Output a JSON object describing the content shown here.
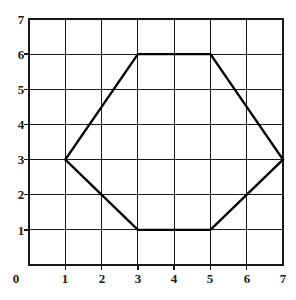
{
  "figure": {
    "kind": "coordinate-grid-with-polygon",
    "background_color": "#ffffff",
    "grid_color": "#1a1a1a",
    "shape_color": "#000000",
    "label_color": "#1a1a1a"
  },
  "chart_data": {
    "type": "scatter",
    "title": "",
    "xlabel": "",
    "ylabel": "",
    "xlim": [
      0,
      7
    ],
    "ylim": [
      0,
      7
    ],
    "grid": true,
    "legend": null,
    "x_ticks": [
      0,
      1,
      2,
      3,
      4,
      5,
      6,
      7
    ],
    "y_ticks": [
      0,
      1,
      2,
      3,
      4,
      5,
      6,
      7
    ],
    "x_tick_labels": [
      "0",
      "1",
      "2",
      "3",
      "4",
      "5",
      "6",
      "7"
    ],
    "y_tick_labels": [
      "0",
      "1",
      "2",
      "3",
      "4",
      "5",
      "6",
      "7"
    ],
    "annotations": [],
    "series": [
      {
        "name": "hexagon",
        "type": "polygon",
        "closed": true,
        "stroke_color": "#000000",
        "stroke_width": 2.4,
        "fill": "none",
        "points": [
          [
            1,
            3
          ],
          [
            3,
            6
          ],
          [
            5,
            6
          ],
          [
            7,
            3
          ],
          [
            5,
            1
          ],
          [
            3,
            1
          ]
        ],
        "x": [
          1,
          3,
          5,
          7,
          5,
          3
        ],
        "y": [
          3,
          6,
          6,
          3,
          1,
          1
        ]
      }
    ]
  },
  "labels": {
    "y": [
      {
        "text": "7",
        "value": 7
      },
      {
        "text": "6",
        "value": 6
      },
      {
        "text": "5",
        "value": 5
      },
      {
        "text": "4",
        "value": 4
      },
      {
        "text": "3",
        "value": 3
      },
      {
        "text": "2",
        "value": 2
      },
      {
        "text": "1",
        "value": 1
      }
    ],
    "x": [
      {
        "text": "0",
        "value": 0
      },
      {
        "text": "1",
        "value": 1
      },
      {
        "text": "2",
        "value": 2
      },
      {
        "text": "3",
        "value": 3
      },
      {
        "text": "4",
        "value": 4
      },
      {
        "text": "5",
        "value": 5
      },
      {
        "text": "6",
        "value": 6
      },
      {
        "text": "7",
        "value": 7
      }
    ]
  }
}
